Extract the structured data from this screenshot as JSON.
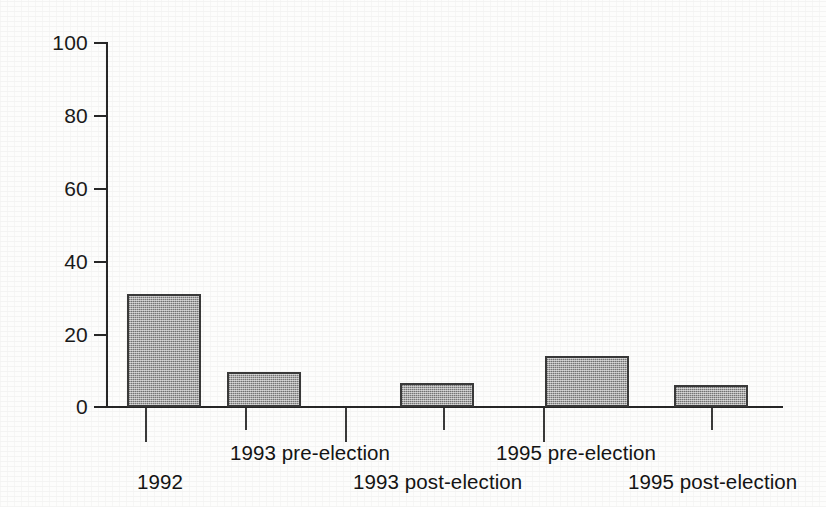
{
  "chart_data": {
    "type": "bar",
    "title": "",
    "subtitle": "",
    "xlabel": "",
    "ylabel": "",
    "categories": [
      "1992",
      "1993 pre-election",
      "1993 post-election",
      "1995 pre-election",
      "1995 post-election"
    ],
    "values": [
      31,
      9.7,
      6.5,
      14,
      6
    ],
    "ylim": [
      0,
      100
    ],
    "yticks": [
      0,
      20,
      40,
      60,
      80,
      100
    ],
    "ytick_labels": [
      "0",
      "20",
      "40",
      "60",
      "80",
      "100"
    ],
    "xtick_labels": [
      "1992",
      "1993 pre-election",
      "1993 post-election",
      "1995 pre-election",
      "1995 post-election"
    ],
    "grid": false,
    "legend": null,
    "legend_position": "none",
    "annotations": [],
    "bar_fill": "#a8a8a8",
    "bar_edge": "#3a3a3a",
    "axis_color": "#272727",
    "background": "#fdfdfc"
  },
  "axes": {
    "y": {
      "ticks": [
        {
          "label": "100",
          "value": 100
        },
        {
          "label": "80",
          "value": 80
        },
        {
          "label": "60",
          "value": 60
        },
        {
          "label": "40",
          "value": 40
        },
        {
          "label": "20",
          "value": 20
        },
        {
          "label": "0",
          "value": 0
        }
      ]
    },
    "x": {
      "labels": [
        {
          "text": "1992",
          "row": "lower"
        },
        {
          "text": "1993 pre-election",
          "row": "upper"
        },
        {
          "text": "1993 post-election",
          "row": "lower"
        },
        {
          "text": "1995 pre-election",
          "row": "upper"
        },
        {
          "text": "1995 post-election",
          "row": "lower"
        }
      ]
    }
  }
}
